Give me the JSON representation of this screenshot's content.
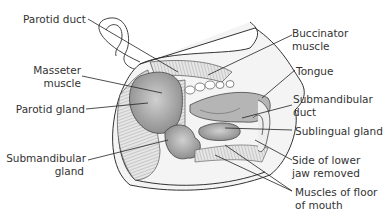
{
  "diagram": {
    "labels": {
      "parotid_duct": "Parotid duct",
      "masseter_1": "Masseter",
      "masseter_2": "muscle",
      "parotid_gland": "Parotid gland",
      "submandibular_gland_1": "Submandibular",
      "submandibular_gland_2": "gland",
      "buccinator_1": "Buccinator",
      "buccinator_2": "muscle",
      "tongue": "Tongue",
      "submandibular_duct_1": "Submandibular",
      "submandibular_duct_2": "duct",
      "sublingual_gland": "Sublingual gland",
      "side_jaw_1": "Side of lower",
      "side_jaw_2": "jaw removed",
      "floor_muscles_1": "Muscles of floor",
      "floor_muscles_2": "of mouth"
    },
    "colors": {
      "line": "#333333",
      "gland": "#9a9a9a",
      "gland_light": "#c8c8c8",
      "muscle": "#dcdcdc",
      "skin": "#ffffff"
    }
  }
}
